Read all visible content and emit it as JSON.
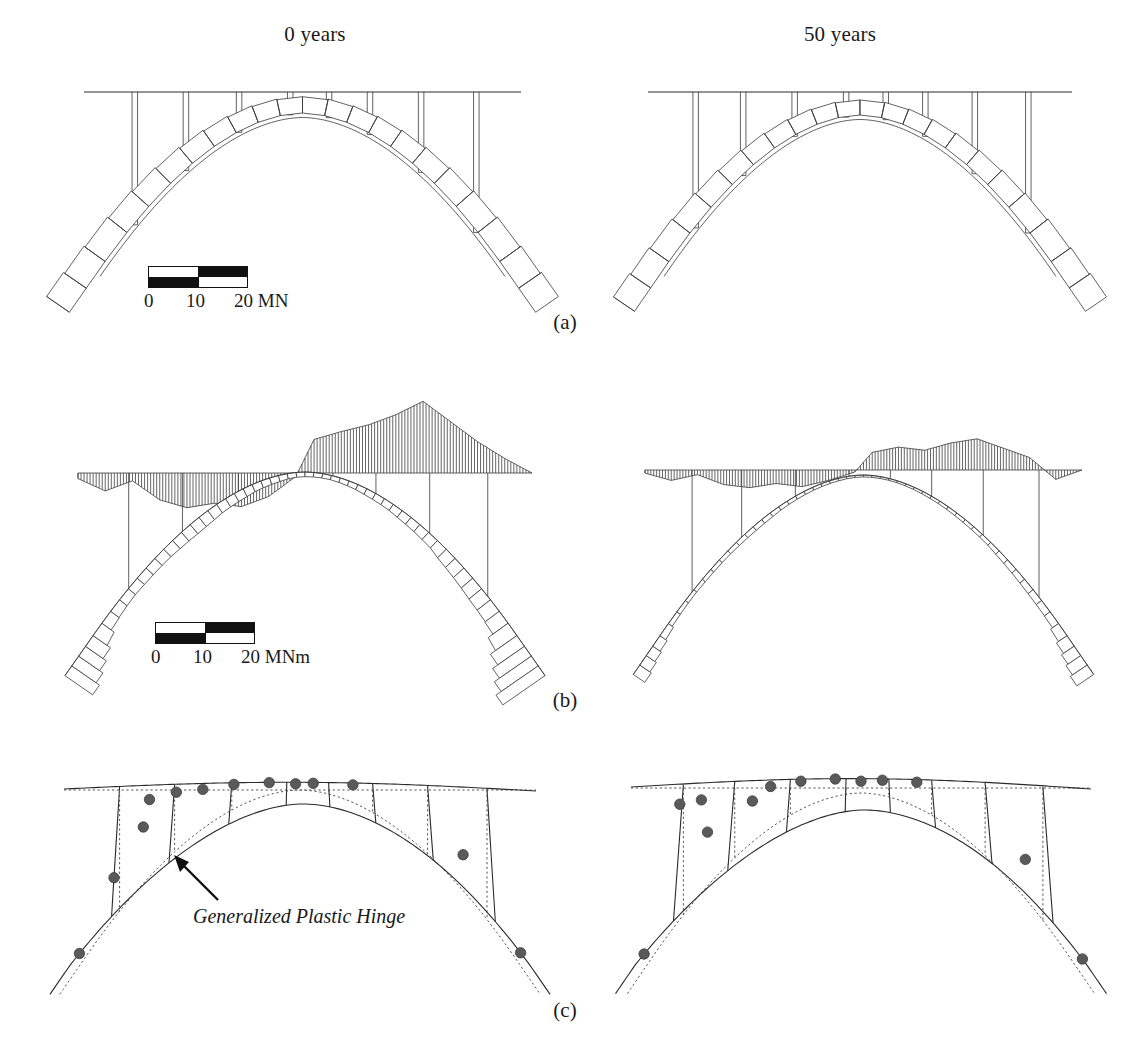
{
  "figure": {
    "column_titles": [
      {
        "id": "left",
        "label": "0 years"
      },
      {
        "id": "right",
        "label": "50 years"
      }
    ],
    "panel_labels": [
      {
        "id": "a",
        "label": "(a)"
      },
      {
        "id": "b",
        "label": "(b)"
      },
      {
        "id": "c",
        "label": "(c)"
      }
    ],
    "annotations": [
      {
        "id": "plastic-hinge",
        "text": "Generalized Plastic Hinge"
      }
    ],
    "colors": {
      "ink": "#2a2a2a",
      "hatch": "#333333",
      "hinge_fill": "#5a5a5a",
      "dotted": "#555555",
      "background": "#ffffff"
    }
  },
  "scalebars": [
    {
      "id": "axial-force",
      "panel": "a",
      "unit": "MN",
      "ticks": [
        "0",
        "10",
        "20 MN"
      ],
      "tick_values": [
        0,
        10,
        20
      ],
      "segments": [
        "white",
        "black",
        "black",
        "white"
      ]
    },
    {
      "id": "bending-moment",
      "panel": "b",
      "unit": "MNm",
      "ticks": [
        "0",
        "10",
        "20 MNm"
      ],
      "tick_values": [
        0,
        10,
        20
      ],
      "segments": [
        "white",
        "black",
        "black",
        "white"
      ]
    }
  ],
  "chart_data": {
    "type": "line",
    "panels": [
      {
        "id": "a",
        "label": "(a)",
        "quantity": "axial force",
        "unit": "MN",
        "scale_max": 20,
        "description": "Axial force bands plotted normal to the arch axis and along the deck"
      },
      {
        "id": "b",
        "label": "(b)",
        "quantity": "bending moment",
        "unit": "MNm",
        "scale_max": 20,
        "description": "Bending moment diagram hatched along deck and arch"
      },
      {
        "id": "c",
        "label": "(c)",
        "quantity": "deformed shape and plastic hinges",
        "unit": "",
        "scale_max": 0,
        "description": "Original geometry dotted, deformed geometry solid, plastic hinges marked"
      }
    ],
    "cases": [
      {
        "id": "left",
        "label": "0 years",
        "age_years": 0
      },
      {
        "id": "right",
        "label": "50 years",
        "age_years": 50
      }
    ],
    "geometry": {
      "arch_span_units": 1.0,
      "arch_rise_ratio": 0.42,
      "columns_per_span": 8
    },
    "series": [
      {
        "panel": "a",
        "case": "left",
        "name": "Axial force - deck, 0 years",
        "x": [
          0.0,
          0.12,
          0.24,
          0.36,
          0.48,
          0.5,
          0.62,
          0.74,
          0.86,
          1.0
        ],
        "values": [
          0.0,
          1.2,
          1.6,
          2.0,
          2.4,
          2.4,
          2.1,
          1.7,
          1.3,
          0.0
        ]
      },
      {
        "panel": "a",
        "case": "left",
        "name": "Axial force - arch, 0 years",
        "x": [
          0.0,
          0.1,
          0.2,
          0.3,
          0.4,
          0.5,
          0.6,
          0.7,
          0.8,
          0.9,
          1.0
        ],
        "values": [
          14.0,
          12.5,
          11.0,
          10.0,
          9.4,
          9.0,
          9.3,
          10.1,
          11.2,
          12.6,
          14.2
        ]
      },
      {
        "panel": "a",
        "case": "right",
        "name": "Axial force - arch, 50 years",
        "x": [
          0.0,
          0.1,
          0.2,
          0.3,
          0.4,
          0.5,
          0.6,
          0.7,
          0.8,
          0.9,
          1.0
        ],
        "values": [
          13.0,
          11.6,
          10.2,
          9.3,
          8.7,
          8.4,
          8.7,
          9.4,
          10.4,
          11.8,
          13.3
        ]
      },
      {
        "panel": "b",
        "case": "left",
        "name": "Bending moment - deck, 0 years",
        "x": [
          0.0,
          0.06,
          0.12,
          0.18,
          0.24,
          0.3,
          0.36,
          0.42,
          0.48,
          0.52,
          0.58,
          0.64,
          0.7,
          0.76,
          0.82,
          0.88,
          0.94,
          1.0
        ],
        "values": [
          -1.0,
          -3.2,
          -1.4,
          -4.8,
          -6.2,
          -5.4,
          -6.0,
          -4.2,
          -0.6,
          6.0,
          7.4,
          8.6,
          10.4,
          12.8,
          9.2,
          5.6,
          2.6,
          0.0
        ]
      },
      {
        "panel": "b",
        "case": "left",
        "name": "Bending moment - arch, 0 years",
        "x": [
          0.0,
          0.08,
          0.16,
          0.24,
          0.32,
          0.4,
          0.48,
          0.56,
          0.64,
          0.72,
          0.8,
          0.88,
          1.0
        ],
        "values": [
          4.2,
          3.0,
          3.4,
          4.0,
          3.2,
          2.4,
          1.6,
          1.4,
          2.0,
          2.6,
          3.4,
          5.0,
          6.4
        ]
      },
      {
        "panel": "b",
        "case": "right",
        "name": "Bending moment - deck, 50 years",
        "x": [
          0.0,
          0.06,
          0.12,
          0.18,
          0.24,
          0.3,
          0.36,
          0.42,
          0.48,
          0.52,
          0.58,
          0.64,
          0.7,
          0.76,
          0.82,
          0.88,
          0.94,
          1.0
        ],
        "values": [
          -0.6,
          -2.0,
          -0.9,
          -2.8,
          -3.4,
          -2.6,
          -3.2,
          -2.0,
          -0.4,
          3.4,
          4.4,
          3.8,
          5.2,
          6.0,
          4.2,
          2.4,
          -1.8,
          0.0
        ]
      },
      {
        "panel": "b",
        "case": "right",
        "name": "Bending moment - arch, 50 years",
        "x": [
          0.0,
          0.08,
          0.16,
          0.24,
          0.32,
          0.4,
          0.48,
          0.56,
          0.64,
          0.72,
          0.8,
          0.88,
          1.0
        ],
        "values": [
          2.6,
          1.8,
          2.0,
          2.4,
          1.8,
          1.4,
          1.0,
          0.9,
          1.2,
          1.6,
          2.0,
          3.0,
          3.8
        ]
      }
    ],
    "hinges": [
      {
        "panel": "c",
        "case": "left",
        "count": 13,
        "positions": [
          [
            0.02,
            0.0
          ],
          [
            0.09,
            0.3
          ],
          [
            0.15,
            0.6
          ],
          [
            0.16,
            0.86
          ],
          [
            0.22,
            0.9
          ],
          [
            0.28,
            0.9
          ],
          [
            0.35,
            0.96
          ],
          [
            0.43,
            0.99
          ],
          [
            0.49,
            0.93
          ],
          [
            0.53,
            0.96
          ],
          [
            0.62,
            0.94
          ],
          [
            0.86,
            0.34
          ],
          [
            0.98,
            0.0
          ]
        ]
      },
      {
        "panel": "c",
        "case": "right",
        "count": 13,
        "positions": [
          [
            0.02,
            0.0
          ],
          [
            0.08,
            0.86
          ],
          [
            0.13,
            0.86
          ],
          [
            0.15,
            0.55
          ],
          [
            0.25,
            0.73
          ],
          [
            0.29,
            0.9
          ],
          [
            0.36,
            0.96
          ],
          [
            0.44,
            0.99
          ],
          [
            0.5,
            0.92
          ],
          [
            0.55,
            0.96
          ],
          [
            0.63,
            0.94
          ],
          [
            0.87,
            0.33
          ],
          [
            0.99,
            0.0
          ]
        ]
      }
    ],
    "axis": {
      "grid": false,
      "legend": false,
      "xlabel": "",
      "ylabel": ""
    }
  }
}
